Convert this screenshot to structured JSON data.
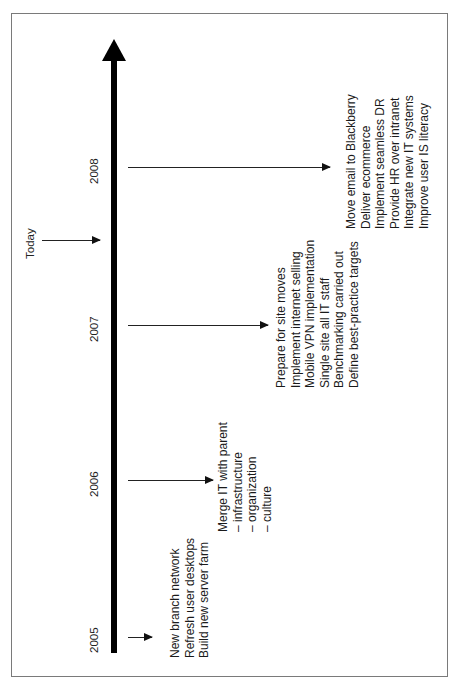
{
  "diagram": {
    "type": "timeline",
    "orientation": "rotated-90-ccw",
    "axis_color": "#000000",
    "frame_color": "#7a7a7a",
    "today_marker": {
      "label": "Today",
      "position_between": [
        "2007",
        "2008"
      ]
    },
    "milestones": [
      {
        "year": "2005",
        "items": [
          "New branch network",
          "Refresh user desktops",
          "Build new server farm"
        ]
      },
      {
        "year": "2006",
        "items": [
          "Merge IT with parent",
          "– infrastructure",
          "– organization",
          "– culture"
        ]
      },
      {
        "year": "2007",
        "items": [
          "Prepare for site moves",
          "Implement internet selling",
          "Mobile VPN implementation",
          "Single site all IT staff",
          "Benchmarking carried out",
          "Define best-practice targets"
        ]
      },
      {
        "year": "2008",
        "items": [
          "Move email to Blackberry",
          "Deliver ecommerce",
          "Implement seamless DR",
          "Provide HR over intranet",
          "Integrate new IT systems",
          "Improve user IS literacy"
        ]
      }
    ]
  }
}
